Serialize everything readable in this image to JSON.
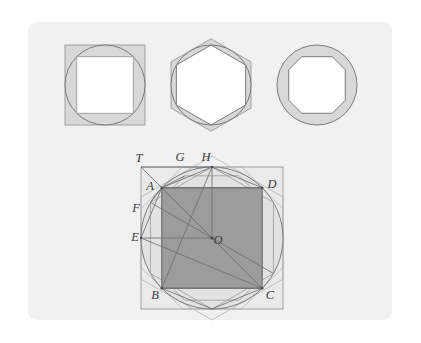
{
  "figure": {
    "kind": "geometry-diagram",
    "topic": "Inscribed and circumscribed regular polygons approximating a circle",
    "panel": {
      "background_color": "#f1f1f1",
      "x": 28,
      "y": 22,
      "width": 364,
      "height": 298,
      "corner_radius": 9
    },
    "colors": {
      "page_background": "#ffffff",
      "panel_background": "#f1f1f1",
      "stroke_dark": "#6f6f72",
      "stroke_light": "#9a9a9d",
      "stroke_faint": "#b4b4b7",
      "fill_inner_square": "#9c9c9c",
      "fill_ring_shade": "#d8d8d8",
      "fill_white": "#ffffff",
      "label_color": "#39393b"
    },
    "small_figures": [
      {
        "name": "square-figure",
        "sides": 4,
        "center": [
          105,
          85
        ],
        "circle_radius": 40,
        "inscribed_polygon": "square",
        "circumscribed_polygon": "square",
        "inscribed_fill": "#ffffff",
        "annulus_fill": "#d8d8d8"
      },
      {
        "name": "hexagon-figure",
        "sides": 6,
        "center": [
          211,
          85
        ],
        "circle_radius": 40,
        "inscribed_polygon": "hexagon",
        "circumscribed_polygon": "hexagon",
        "inscribed_fill": "#ffffff",
        "annulus_fill": "#d8d8d8"
      },
      {
        "name": "octagon-figure",
        "sides": 8,
        "center": [
          317,
          85
        ],
        "circle_radius": 40,
        "inscribed_polygon": "octagon",
        "circumscribed_polygon": "octagon",
        "inscribed_fill": "#ffffff",
        "annulus_fill": "#d8d8d8"
      }
    ],
    "main_figure": {
      "name": "composite-figure",
      "center": [
        212,
        238
      ],
      "circle_radius": 71,
      "outer_square": {
        "x": 143,
        "y": 164,
        "width": 138,
        "height": 138
      },
      "inscribed_square_fill": "#9c9c9c",
      "layers": [
        "circumscribed-square",
        "circle",
        "inscribed-square-ABCD",
        "inscribed-hexagon",
        "circumscribed-hexagon",
        "inscribed-octagon",
        "circumscribed-octagon",
        "radii-and-chords"
      ],
      "labels": [
        {
          "text": "T",
          "x": 139,
          "y": 162,
          "role": "circumscribed-square-corner"
        },
        {
          "text": "G",
          "x": 180,
          "y": 161,
          "role": "octagon-vertex"
        },
        {
          "text": "H",
          "x": 206,
          "y": 161,
          "role": "circle-top-point"
        },
        {
          "text": "A",
          "x": 150,
          "y": 190,
          "role": "square-vertex"
        },
        {
          "text": "D",
          "x": 262,
          "y": 188,
          "role": "square-vertex"
        },
        {
          "text": "F",
          "x": 136,
          "y": 210,
          "role": "hexagon-vertex"
        },
        {
          "text": "E",
          "x": 135,
          "y": 239,
          "role": "circle-left-point"
        },
        {
          "text": "O",
          "x": 216,
          "y": 244,
          "role": "center"
        },
        {
          "text": "B",
          "x": 152,
          "y": 296,
          "role": "square-vertex"
        },
        {
          "text": "C",
          "x": 266,
          "y": 296,
          "role": "square-vertex"
        }
      ]
    }
  }
}
